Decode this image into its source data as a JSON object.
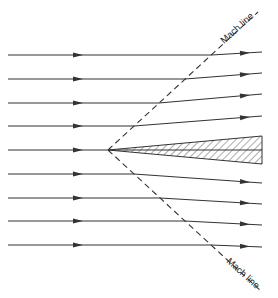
{
  "diagram": {
    "type": "supersonic flow over a thin wedge",
    "labels": {
      "upper_mach_line": "Mach line",
      "lower_mach_line": "Mach line"
    },
    "colors": {
      "stroke": "#333333",
      "hatch": "#444444",
      "background": "#ffffff"
    },
    "wedge": {
      "tip": [
        108,
        150
      ],
      "upper_end": [
        262,
        136
      ],
      "lower_end": [
        262,
        164
      ]
    },
    "mach_lines": {
      "upper": {
        "from": [
          108,
          150
        ],
        "to": [
          258,
          12
        ]
      },
      "lower": {
        "from": [
          108,
          150
        ],
        "to": [
          262,
          292
        ]
      }
    },
    "streamlines": [
      {
        "y_left": 55,
        "y_right": 52
      },
      {
        "y_left": 79,
        "y_right": 73
      },
      {
        "y_left": 103,
        "y_right": 94
      },
      {
        "y_left": 126,
        "y_right": 116
      },
      {
        "y_left": 150,
        "y_right": 150
      },
      {
        "y_left": 174,
        "y_right": 183
      },
      {
        "y_left": 198,
        "y_right": 204
      },
      {
        "y_left": 221,
        "y_right": 225
      },
      {
        "y_left": 245,
        "y_right": 247
      }
    ]
  }
}
